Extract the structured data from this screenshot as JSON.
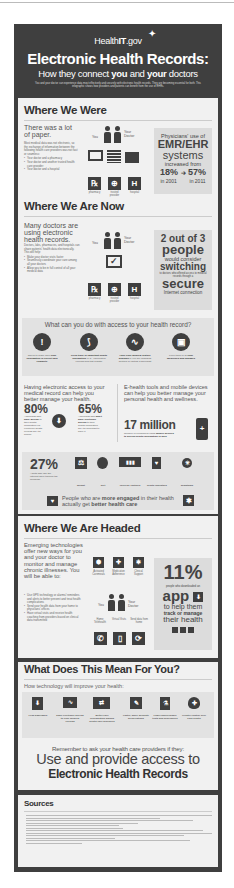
{
  "header": {
    "brand": "HealthIT.gov",
    "brand_prefix": "Health",
    "brand_it": "IT",
    "brand_suffix": ".gov",
    "title": "Electronic Health Records:",
    "subtitle_pre": "How they connect ",
    "subtitle_you": "you",
    "subtitle_mid": " and ",
    "subtitle_your": "your",
    "subtitle_post": " doctors",
    "intro": "You and your doctor can experience data most effectively and securely with electronic health records. They are becoming essential for both. This infographic shows how providers and patients can benefit from the use of EHRs."
  },
  "where_we_were": {
    "title": "Where We Were",
    "lead": "There was a lot of paper.",
    "body": "Most medical data was not electronic, so the exchange of information between the following health care providers was not fast or seamless:",
    "bullets": [
      "Your doctor and a pharmacy",
      "Your doctor and another trusted health care provider",
      "Your doctor and a hospital"
    ],
    "you_label": "You",
    "doctor_label": "Your Doctor",
    "icons": [
      {
        "glyph": "℞",
        "label": "pharmacy"
      },
      {
        "glyph": "⊕",
        "label": "trusted provider"
      },
      {
        "glyph": "H",
        "label": "hospital"
      }
    ],
    "stat": {
      "line1": "Physicians' use of",
      "line2": "EMR/EHR",
      "line3": "systems",
      "line4": "increased from",
      "from_value": "18%",
      "from_year": "in 2001",
      "to_value": "57%",
      "to_year": "in 2011",
      "footnote": "1"
    }
  },
  "where_we_are_now": {
    "title": "Where We Are Now",
    "lead": "Many doctors are using electronic health records.",
    "body": "Doctors, labs, pharmacies, and hospitals can share patients' health data electronically. This will help:",
    "bullets": [
      "Make your doctor visits faster",
      "Seamlessly coordinate your care among all your doctors",
      "Allow you to be in full control of all your medical data"
    ],
    "you_label": "You",
    "doctor_label": "Your Doctor",
    "icons": [
      {
        "glyph": "℞",
        "label": "pharmacy"
      },
      {
        "glyph": "⊕",
        "label": "trusted provider"
      },
      {
        "glyph": "H",
        "label": "hospital"
      }
    ],
    "stat": {
      "line1": "2 out of 3",
      "line2": "people",
      "line3": "would consider",
      "line4": "switching",
      "line5": "to doctors who offered access to medical records through a",
      "line6": "secure",
      "line7": "Internet connection",
      "footnote": "2"
    }
  },
  "access": {
    "title": "What can you do with access to your health record?",
    "items": [
      {
        "glyph": "!",
        "text_pre": "Check to make sure",
        "text_bold": "your information is correct and complete",
        "text_post": ""
      },
      {
        "glyph": "⟆",
        "text_pre": "",
        "text_bold": "Keep track of important health information",
        "text_post": "(e.g., vaccination records and test results)"
      },
      {
        "glyph": "∿",
        "text_pre": "",
        "text_bold": "Have your medical history available",
        "text_post": "if you are changing doctors or visiting a specialist"
      },
      {
        "glyph": "▣",
        "text_pre": "Keep track of all",
        "text_bold": "your medicines and dosages",
        "text_post": ""
      }
    ]
  },
  "manage": {
    "left_lead": "Having electronic access to your medical record can help you better manage your health.",
    "stat1": {
      "value": "80%",
      "text_pre": "Americans who",
      "text_bold": "have access",
      "text_post": "to their health information via electronic health records say it's helpful"
    },
    "stat2": {
      "value": "65%",
      "text_pre": "Americans who",
      "text_bold": "don't have electronic access",
      "text_post": "to their health information say it's important to have it"
    },
    "right_lead": "E-health tools and mobile devices can help you better manage your personal health and wellness.",
    "big_value": "17 million",
    "big_text_pre": "Number of consumers using",
    "big_text_bold": "mobile devices to access health information in 2011",
    "footnote": "3"
  },
  "tracking": {
    "value": "27%",
    "text": "Adults who use the Internet have tracked the following:",
    "items": [
      {
        "glyph": "⚖",
        "label": "weight"
      },
      {
        "glyph": "●",
        "label": "diet"
      },
      {
        "glyph": "▮▮▮",
        "label": "exercise routines"
      },
      {
        "glyph": "♥",
        "label": "health indicators"
      },
      {
        "glyph": "✳",
        "label": "symptoms"
      }
    ],
    "banner_pre": "People who are ",
    "banner_bold1": "more engaged",
    "banner_mid": " in their health actually get ",
    "banner_bold2": "better health care",
    "footnote": "5"
  },
  "where_we_are_headed": {
    "title": "Where We Are Headed",
    "lead": "Emerging technologies offer new ways for you and your doctor to monitor and manage chronic illnesses. You will be able to:",
    "bullets": [
      "Use GPS technology or alarms/ reminders and alerts to better prevent and treat health complications",
      "Send your health data from your home to physicians' offices",
      "Have virtual visits and receive health coaching from providers based on clinical data transmitted"
    ],
    "top_icons": [
      {
        "glyph": "⬢",
        "label": "Activated Caremeals"
      },
      {
        "glyph": "✚",
        "label": "Medication Adherence"
      },
      {
        "glyph": "✱",
        "label": "Clinical Support"
      }
    ],
    "you_label": "You",
    "doctor_label": "Your Doctor",
    "bottom_labels": [
      "Home Telehealth",
      "Virtual Visits",
      "Send data from home"
    ],
    "bottom_icons": [
      {
        "glyph": "✆",
        "label": "phone"
      },
      {
        "glyph": "▯",
        "label": "mobile"
      },
      {
        "glyph": "⟳",
        "label": "sync"
      }
    ],
    "stat": {
      "value": "11%",
      "line1": "people who downloaded an",
      "line2": "app",
      "line3": "to help them",
      "line4": "track or manage",
      "line5": "their health",
      "footnote": "6"
    }
  },
  "what_it_means": {
    "title": "What Does This Mean For You?",
    "subtitle": "How technology will improve your health:",
    "items": [
      {
        "glyph": "⬇",
        "label": "Less paperwork"
      },
      {
        "glyph": "∿",
        "label": "Easy electronic access to your medical records"
      },
      {
        "glyph": "⇄",
        "label": "Better care coordination among health care providers"
      },
      {
        "glyph": "✎",
        "label": "Faster, more accurate prescriptions"
      },
      {
        "glyph": "⚗",
        "label": "Fewer unnecessary tests and procedures"
      },
      {
        "glyph": "✚",
        "label": "Greater control over your health"
      }
    ]
  },
  "remember": {
    "line1": "Remember to ask your health care providers if they:",
    "line2": "Use and provide access to",
    "line3": "Electronic Health Records"
  },
  "sources": {
    "title": "Sources",
    "line_count": 12
  }
}
